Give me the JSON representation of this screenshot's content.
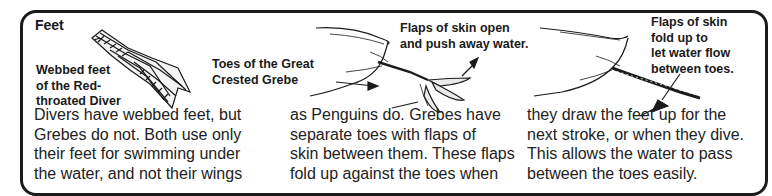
{
  "section": {
    "title": "Feet"
  },
  "illustrations": [
    {
      "name": "diver-webbed-foot",
      "icon": "webbed-foot-icon"
    },
    {
      "name": "grebe-foot-open",
      "icon": "lobed-foot-open-icon"
    },
    {
      "name": "grebe-foot-folded",
      "icon": "lobed-foot-folded-icon"
    }
  ],
  "captions": {
    "diver": [
      "Webbed feet",
      "of the Red-",
      "throated Diver"
    ],
    "grebe": [
      "Toes of the Great",
      "Crested Grebe"
    ],
    "flaps_open": [
      "Flaps of skin open",
      "and push away water."
    ],
    "flaps_fold": [
      "Flaps of skin",
      "fold up to",
      "let water flow",
      "between toes."
    ]
  },
  "body": {
    "col1": [
      "Divers have webbed feet, but",
      "Grebes do not. Both use only",
      "their feet for swimming under",
      "the water, and not their wings"
    ],
    "col2": [
      "as Penguins do. Grebes have",
      "separate toes with flaps of",
      "skin between them. These flaps",
      "fold up against the toes when"
    ],
    "col3": [
      "they draw the feet up for the",
      "next stroke, or when they dive.",
      "This allows the water to pass",
      "between the toes easily."
    ]
  },
  "colors": {
    "ink": "#1a1a1a",
    "paper": "#ffffff"
  }
}
